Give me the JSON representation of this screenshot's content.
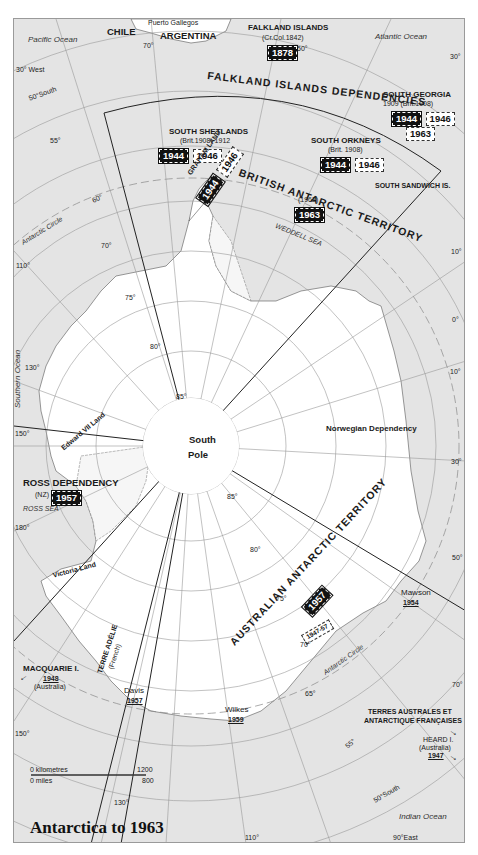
{
  "title": "Antarctica to 1963",
  "oceans": {
    "pacific": "Pacific Ocean",
    "atlantic": "Atlantic Ocean",
    "southern": "Southern Ocean",
    "indian": "Indian Ocean"
  },
  "seas": {
    "weddell": "WEDDELL SEA",
    "ross": "ROSS SEA"
  },
  "countries": {
    "chile": "CHILE",
    "argentina": "ARGENTINA",
    "puerto_gallegos": "Puerto Gallegos"
  },
  "territories": {
    "falkland_islands": {
      "name": "FALKLAND ISLANDS",
      "note": "(Cr.Col.1842)",
      "year": "1878"
    },
    "falkland_dependencies": {
      "name": "FALKLAND ISLANDS DEPENDENCIES"
    },
    "south_georgia": {
      "name": "SOUTH GEORGIA",
      "note": "1909 (Brit.1908)",
      "years_black": [
        "1944"
      ],
      "years_white": [
        "1946",
        "1963"
      ]
    },
    "south_shetlands": {
      "name": "SOUTH SHETLANDS",
      "note": "(Brit.1908) 1912",
      "years_black": [
        "1944"
      ],
      "years_white": [
        "1946"
      ]
    },
    "south_orkneys": {
      "name": "SOUTH ORKNEYS",
      "note": "(Brit. 1908)",
      "years_black": [
        "1944"
      ],
      "years_white": [
        "1946"
      ]
    },
    "graham_land": {
      "name": "GRAHAM LAND",
      "years_black": [
        "1944"
      ],
      "years_white": [
        "1946"
      ]
    },
    "british_antarctic": {
      "name": "BRITISH ANTARCTIC TERRITORY",
      "note": "(1962)",
      "year": "1963"
    },
    "south_sandwich": {
      "name": "SOUTH SANDWICH IS."
    },
    "norwegian": {
      "name": "Norwegian Dependency"
    },
    "ross_dependency": {
      "name": "ROSS DEPENDENCY",
      "note": "(NZ)",
      "year": "1957"
    },
    "edward_vii": {
      "name": "Edward VII Land"
    },
    "victoria_land": {
      "name": "Victoria Land"
    },
    "australian": {
      "name": "AUSTRALIAN ANTARCTIC TERRITORY",
      "year_range": "1947-57",
      "year": "1957"
    },
    "terre_adelie": {
      "name": "TERRE ADÉLIE",
      "note": "(French)"
    },
    "macquarie": {
      "name": "MACQUARIE I.",
      "year": "1948",
      "note": "(Australia)"
    },
    "taaf": {
      "line1": "TERRES AUSTRALES ET",
      "line2": "ANTARCTIQUE FRANÇAISES"
    },
    "heard": {
      "name": "HEARD I.",
      "note": "(Australia)",
      "year": "1947"
    }
  },
  "stations": {
    "mawson": {
      "name": "Mawson",
      "year": "1954"
    },
    "davis": {
      "name": "Davis",
      "year": "1957"
    },
    "wilkes": {
      "name": "Wilkes",
      "year": "1959"
    }
  },
  "pole": {
    "line1": "South",
    "line2": "Pole"
  },
  "circles": {
    "antarctic_1": "Antarctic Circle",
    "antarctic_2": "Antarctic Circle"
  },
  "ticks": {
    "w30": "30° West",
    "s50_top": "50°South",
    "s55_top": "55°",
    "s60": "60°",
    "s65": "65°",
    "s70": "70°",
    "s75": "75°",
    "s80": "80°",
    "s85_top": "85°",
    "w70": "70°",
    "w50": "50°",
    "e30_top": "30°",
    "e10_top": "10°",
    "zero": "0°",
    "e10": "10°",
    "e30": "30°",
    "e50": "50°",
    "e70": "70°",
    "w110": "110°",
    "w130": "130°",
    "w150": "150°",
    "w180": "180°",
    "e150": "150°",
    "e130": "130°",
    "e110": "110°",
    "e90": "90°East",
    "s85_bot": "85°",
    "s80_bot": "80°",
    "s75_bot": "75°",
    "s70_bot": "70°",
    "s65_bot": "65°",
    "s55_bot": "55°",
    "s50_bot": "50°South"
  },
  "scale": {
    "km_label": "0 kilometres",
    "km_max": "1200",
    "mi_label": "0 miles",
    "mi_max": "800"
  }
}
